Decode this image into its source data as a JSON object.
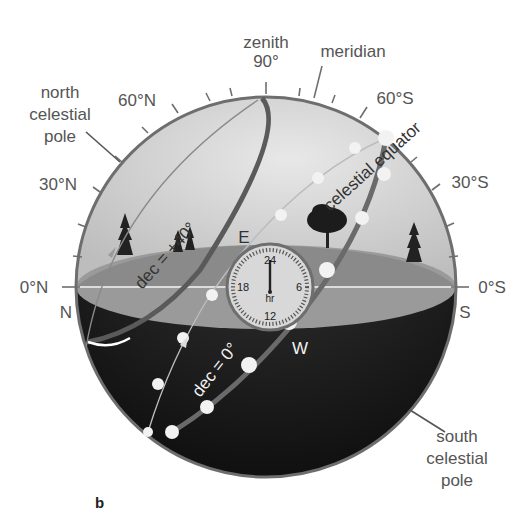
{
  "figure": {
    "panel_label": "b"
  },
  "labels": {
    "zenith": "zenith",
    "zenith_angle": "90°",
    "meridian": "meridian",
    "north_celestial_pole": [
      "north",
      "celestial",
      "pole"
    ],
    "south_celestial_pole": [
      "south",
      "celestial",
      "pole"
    ],
    "celestial_equator": "celestial equator",
    "dec_plus40": "dec = +40°",
    "dec_zero": "dec = 0°"
  },
  "altitude_ticks": {
    "north_side": [
      "60°N",
      "30°N",
      "0°N"
    ],
    "south_side": [
      "60°S",
      "30°S",
      "0°S"
    ]
  },
  "horizon_directions": {
    "north": "N",
    "south": "S",
    "east": "E",
    "west": "W"
  },
  "clock": {
    "numbers": [
      "24",
      "6",
      "12",
      "18"
    ],
    "unit": "hr",
    "hand_points_to": "24"
  },
  "colors": {
    "sky": "#cfcfcf",
    "sky_light": "#e4e4e4",
    "ground_top": "#8c8c8c",
    "ground_band": "#a8a8a8",
    "below_horizon": "#1e1e1e",
    "sphere_outline": "#6e6e6e",
    "dec40_track": "#5a5a5a",
    "star_dot": "#f0f0f0",
    "label_text": "#555555"
  }
}
